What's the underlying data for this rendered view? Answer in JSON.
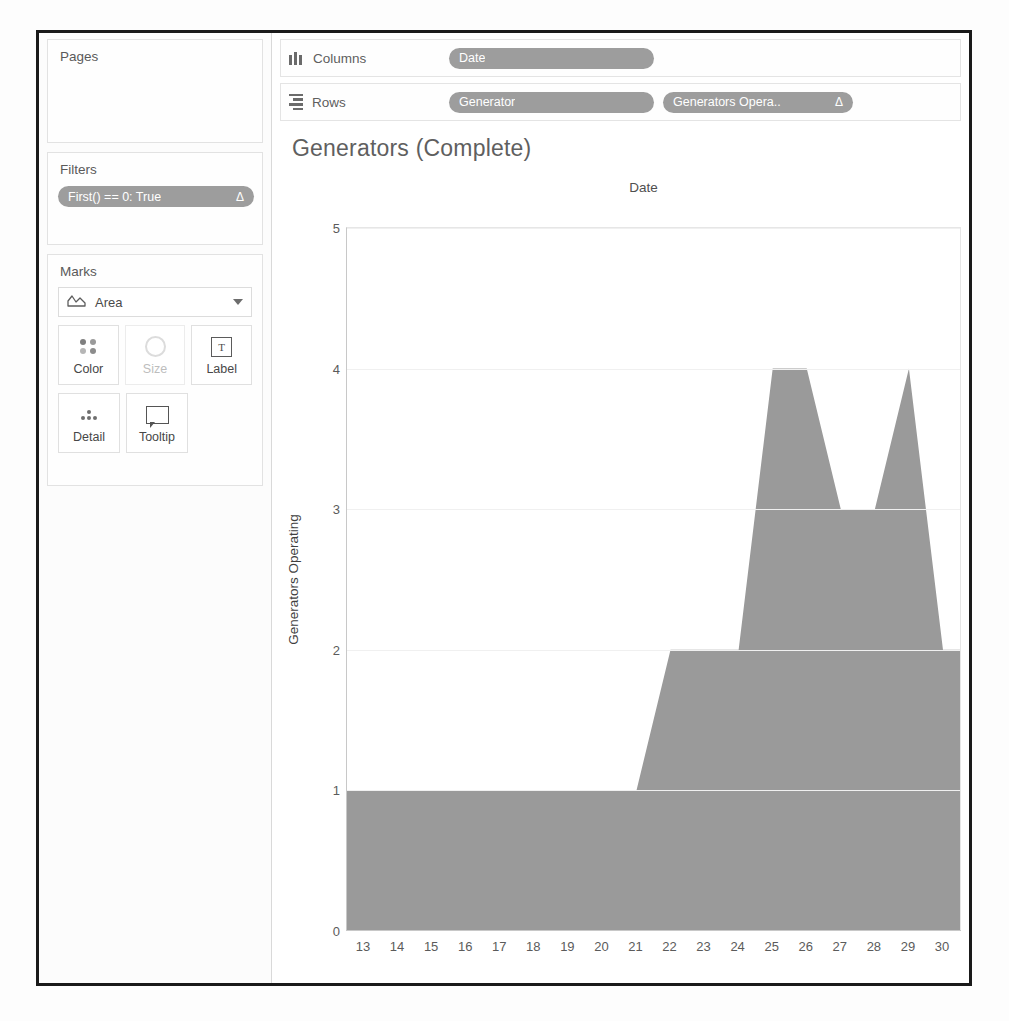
{
  "sidebar": {
    "pages": {
      "title": "Pages"
    },
    "filters": {
      "title": "Filters",
      "pill": {
        "label": "First() == 0: True",
        "delta": "Δ"
      }
    },
    "marks": {
      "title": "Marks",
      "type": {
        "value": "Area",
        "icon": "area-chart-icon",
        "caret": "chevron-down-icon"
      },
      "buttons": [
        {
          "label": "Color",
          "icon": "color-dots-icon",
          "disabled": false
        },
        {
          "label": "Size",
          "icon": "size-circle-icon",
          "disabled": true
        },
        {
          "label": "Label",
          "icon": "text-label-icon",
          "disabled": false
        },
        {
          "label": "Detail",
          "icon": "detail-dots-icon",
          "disabled": false
        },
        {
          "label": "Tooltip",
          "icon": "tooltip-icon",
          "disabled": false
        }
      ]
    }
  },
  "shelves": {
    "columns": {
      "label": "Columns",
      "icon": "columns-icon",
      "pills": [
        {
          "label": "Date",
          "delta": ""
        }
      ]
    },
    "rows": {
      "label": "Rows",
      "icon": "rows-icon",
      "pills": [
        {
          "label": "Generator",
          "delta": ""
        },
        {
          "label": "Generators Opera..",
          "delta": "Δ"
        }
      ]
    }
  },
  "viz": {
    "title": "Generators (Complete)",
    "column_header": "Date"
  },
  "colors": {
    "area_fill": "#9a9a9a",
    "pill_bg": "#9d9d9d",
    "axis": "#c8c8c8",
    "grid": "#f0f0f0",
    "window_border": "#1a1a1a"
  },
  "chart_data": {
    "type": "area",
    "title": "Generators (Complete)",
    "xlabel": "Date",
    "ylabel": "Generators Operating",
    "x": [
      13,
      14,
      15,
      16,
      17,
      18,
      19,
      20,
      21,
      22,
      23,
      24,
      25,
      26,
      27,
      28,
      29,
      30
    ],
    "values": [
      1,
      1,
      1,
      1,
      1,
      1,
      1,
      1,
      1,
      2,
      2,
      2,
      4,
      4,
      3,
      3,
      4,
      2
    ],
    "xticklabels": [
      "13",
      "14",
      "15",
      "16",
      "17",
      "18",
      "19",
      "20",
      "21",
      "22",
      "23",
      "24",
      "25",
      "26",
      "27",
      "28",
      "29",
      "30"
    ],
    "yticklabels": [
      "0",
      "1",
      "2",
      "3",
      "4",
      "5"
    ],
    "ylim": [
      0,
      5
    ],
    "yticks": [
      0,
      1,
      2,
      3,
      4,
      5
    ],
    "grid": true,
    "legend": "none",
    "series": [
      {
        "name": "Generators Operating",
        "values": [
          1,
          1,
          1,
          1,
          1,
          1,
          1,
          1,
          1,
          2,
          2,
          2,
          4,
          4,
          3,
          3,
          4,
          2
        ]
      }
    ]
  }
}
